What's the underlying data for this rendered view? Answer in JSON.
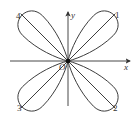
{
  "diagram": {
    "type": "four-leaf rose curve",
    "axes": {
      "x_label": "x",
      "y_label": "y",
      "origin_label": "O"
    },
    "petals": [
      {
        "label": "1",
        "quadrant": "I"
      },
      {
        "label": "2",
        "quadrant": "IV"
      },
      {
        "label": "3",
        "quadrant": "III"
      },
      {
        "label": "4",
        "quadrant": "II"
      }
    ],
    "colors": {
      "stroke": "#333333",
      "background": "#ffffff"
    }
  }
}
